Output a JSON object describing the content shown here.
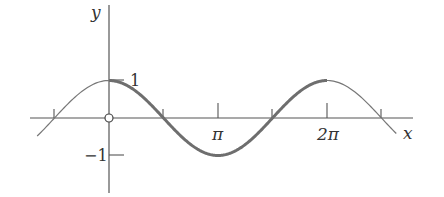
{
  "chart_data": {
    "type": "line",
    "title": "",
    "function": "y = cos(x)",
    "xlabel": "x",
    "ylabel": "y",
    "x_tick_labels": [
      "π",
      "2π"
    ],
    "x_tick_values": [
      3.14159,
      6.28318
    ],
    "unlabeled_x_ticks": [
      -1.5708,
      1.5708,
      4.7124,
      7.854
    ],
    "y_tick_labels": [
      "1",
      "-1"
    ],
    "y_tick_values": [
      1,
      -1
    ],
    "xlim": [
      -2.07,
      8.28
    ],
    "ylim": [
      -1,
      1
    ],
    "grid": false,
    "legend": null,
    "series": [
      {
        "name": "cos(x) thin extension",
        "x_range": [
          -2.07,
          8.28
        ],
        "style": "thin"
      },
      {
        "name": "cos(x) highlighted period",
        "x_range": [
          0,
          6.28318
        ],
        "style": "thick"
      }
    ],
    "sample_points": [
      {
        "x": -1.5708,
        "y": 0
      },
      {
        "x": 0,
        "y": 1
      },
      {
        "x": 1.5708,
        "y": 0
      },
      {
        "x": 3.14159,
        "y": -1
      },
      {
        "x": 4.7124,
        "y": 0
      },
      {
        "x": 6.28318,
        "y": 1
      },
      {
        "x": 7.854,
        "y": 0
      }
    ],
    "annotations": [
      "open circle at origin (0,0)"
    ]
  },
  "labels": {
    "y_axis": "y",
    "x_axis": "x",
    "one": "1",
    "minus_one": "−1",
    "pi": "π",
    "two_pi": "2π"
  },
  "colors": {
    "axis": "#555555",
    "curve": "#777777",
    "highlight": "#6e6e6e"
  }
}
